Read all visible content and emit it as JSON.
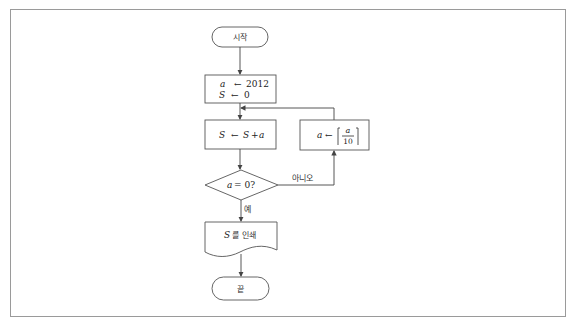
{
  "diagram": {
    "type": "flowchart",
    "start": {
      "label": "시작"
    },
    "init": {
      "line1_var": "a",
      "line1_op": "←",
      "line1_val": "2012",
      "line2_var": "S",
      "line2_op": "←",
      "line2_val": "0"
    },
    "accumulate": {
      "var": "S",
      "op": "←",
      "expr_var": "S",
      "expr_plus": "+",
      "expr_term": "a"
    },
    "decision": {
      "var": "a",
      "cond": "= 0?"
    },
    "update": {
      "var": "a",
      "op": "←",
      "num": "a",
      "den": "10",
      "note": "floor(a/10)"
    },
    "labels": {
      "no": "아니오",
      "yes": "예"
    },
    "output": {
      "var": "S",
      "text": "를 인쇄"
    },
    "end": {
      "label": "끝"
    },
    "colors": {
      "stroke": "#555555",
      "frame": "#9a9a9a",
      "text": "#222222"
    }
  }
}
